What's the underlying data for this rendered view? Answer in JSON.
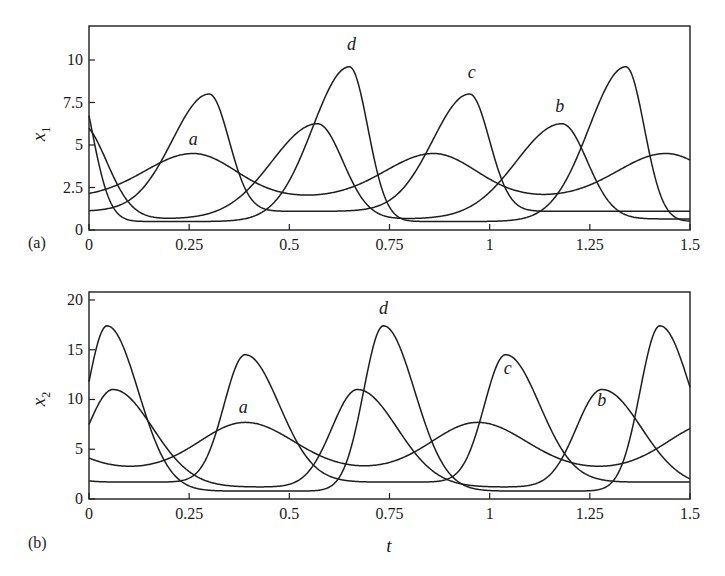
{
  "chart_data": [
    {
      "panel": "(a)",
      "type": "line",
      "title": "",
      "xlabel": "",
      "ylabel": "x1",
      "ylabel_main": "x",
      "ylabel_sub": "1",
      "xlim": [
        0,
        1.5
      ],
      "ylim": [
        0,
        12
      ],
      "xticks": [
        0,
        0.25,
        0.5,
        0.75,
        1,
        1.25,
        1.5
      ],
      "xtick_labels": [
        "0",
        "0.25",
        "0.5",
        "0.75",
        "1",
        "1.25",
        "1.5"
      ],
      "yticks": [
        0,
        2.5,
        5,
        7.5,
        10
      ],
      "ytick_labels": [
        "0",
        "2.5",
        "5",
        "7.5",
        "10"
      ],
      "grid": false,
      "legend": "none (curves labeled inline)",
      "series": [
        {
          "name": "a",
          "base": 1.9,
          "amp": 2.6,
          "peaks": [
            0.26,
            0.86,
            1.44
          ],
          "rise": 0.17,
          "fall": 0.15,
          "peak_value": 4.5
        },
        {
          "name": "b",
          "base": 0.65,
          "amp": 5.6,
          "peaks": [
            -0.02,
            0.57,
            1.18
          ],
          "rise": 0.16,
          "fall": 0.09,
          "peak_value": 6.2
        },
        {
          "name": "c",
          "base": 1.1,
          "amp": 6.9,
          "peaks": [
            -0.35,
            0.3,
            0.95
          ],
          "rise": 0.13,
          "fall": 0.07,
          "peak_value": 8.0
        },
        {
          "name": "d",
          "base": 0.5,
          "amp": 9.1,
          "peaks": [
            -0.04,
            0.65,
            1.34
          ],
          "rise": 0.13,
          "fall": 0.065,
          "peak_value": 9.6
        }
      ],
      "annotations": [
        {
          "text": "a",
          "x": 0.26,
          "y": 5.0
        },
        {
          "text": "d",
          "x": 0.655,
          "y": 10.6
        },
        {
          "text": "c",
          "x": 0.955,
          "y": 8.95
        },
        {
          "text": "b",
          "x": 1.175,
          "y": 6.95
        }
      ]
    },
    {
      "panel": "(b)",
      "type": "line",
      "title": "",
      "xlabel": "t",
      "ylabel": "x2",
      "ylabel_main": "x",
      "ylabel_sub": "2",
      "xlim": [
        0,
        1.5
      ],
      "ylim": [
        0,
        20.8
      ],
      "xticks": [
        0,
        0.25,
        0.5,
        0.75,
        1,
        1.25,
        1.5
      ],
      "xtick_labels": [
        "0",
        "0.25",
        "0.5",
        "0.75",
        "1",
        "1.25",
        "1.5"
      ],
      "yticks": [
        0,
        5,
        10,
        15,
        20
      ],
      "ytick_labels": [
        "0",
        "5",
        "10",
        "15",
        "20"
      ],
      "grid": false,
      "legend": "none (curves labeled inline)",
      "series": [
        {
          "name": "a",
          "base": 2.9,
          "amp": 4.8,
          "peaks": [
            -0.2,
            0.39,
            0.97,
            1.56
          ],
          "rise": 0.16,
          "fall": 0.17,
          "peak_value": 7.7
        },
        {
          "name": "b",
          "base": 1.2,
          "amp": 9.8,
          "peaks": [
            0.06,
            0.67,
            1.28
          ],
          "rise": 0.09,
          "fall": 0.14,
          "peak_value": 11.0
        },
        {
          "name": "c",
          "base": 1.7,
          "amp": 12.8,
          "peaks": [
            -0.26,
            0.39,
            1.04,
            1.69
          ],
          "rise": 0.075,
          "fall": 0.12,
          "peak_value": 14.5
        },
        {
          "name": "d",
          "base": 0.8,
          "amp": 16.6,
          "peaks": [
            0.045,
            0.735,
            1.425
          ],
          "rise": 0.07,
          "fall": 0.11,
          "peak_value": 17.4
        }
      ],
      "annotations": [
        {
          "text": "a",
          "x": 0.385,
          "y": 8.6
        },
        {
          "text": "d",
          "x": 0.735,
          "y": 18.6
        },
        {
          "text": "c",
          "x": 1.045,
          "y": 12.6
        },
        {
          "text": "b",
          "x": 1.28,
          "y": 9.3
        }
      ]
    }
  ],
  "figure": {
    "panel_labels": [
      "(a)",
      "(b)"
    ],
    "shared_xlabel": "t"
  }
}
